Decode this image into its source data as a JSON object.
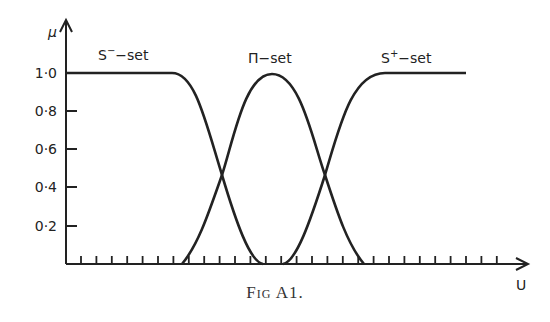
{
  "chart_data": {
    "type": "line",
    "title": "",
    "caption": "Fig A1.",
    "xlabel": "U",
    "ylabel": "μ",
    "ylim": [
      0,
      1.0
    ],
    "yticks": [
      "0·2",
      "0·4",
      "0·6",
      "0·8",
      "1·0"
    ],
    "x_ticks_unlabeled": 28,
    "grid": false,
    "legend": "inline labels",
    "series": [
      {
        "name": "S⁻-set",
        "label_html": "S",
        "sup": "−",
        "suffix": "-set",
        "points": [
          [
            0,
            1.0
          ],
          [
            0.27,
            1.0
          ],
          [
            0.35,
            0.47
          ],
          [
            0.42,
            0.0
          ],
          [
            1.0,
            0.0
          ]
        ]
      },
      {
        "name": "Π-set",
        "label": "Π-set",
        "points": [
          [
            0.26,
            0.0
          ],
          [
            0.35,
            0.47
          ],
          [
            0.435,
            1.0
          ],
          [
            0.52,
            0.47
          ],
          [
            0.61,
            0.0
          ]
        ]
      },
      {
        "name": "S⁺-set",
        "label_html": "S",
        "sup": "+",
        "suffix": "-set",
        "points": [
          [
            0,
            0.0
          ],
          [
            0.49,
            0.0
          ],
          [
            0.52,
            0.47
          ],
          [
            0.68,
            1.0
          ],
          [
            0.87,
            1.0
          ]
        ]
      }
    ]
  },
  "labels": {
    "mu": "μ",
    "u": "U",
    "s_minus": "S",
    "s_minus_sup": "−",
    "s_minus_suffix": "−set",
    "pi": "Π−set",
    "s_plus": "S",
    "s_plus_sup": "+",
    "s_plus_suffix": "−set",
    "y10": "1·0",
    "y08": "0·8",
    "y06": "0·6",
    "y04": "0·4",
    "y02": "0·2",
    "caption": "Fig A1."
  }
}
